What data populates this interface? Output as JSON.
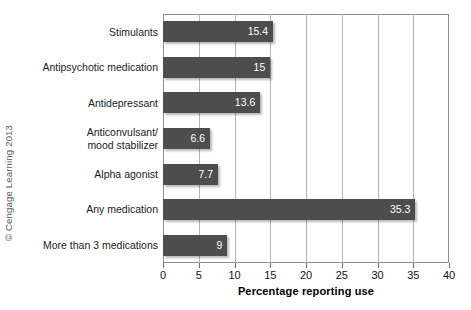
{
  "credit": "© Cengage Learning 2013",
  "chart_data": {
    "type": "bar",
    "orientation": "horizontal",
    "title": "",
    "xlabel": "Percentage reporting use",
    "ylabel": "",
    "xlim": [
      0,
      40
    ],
    "xticks": [
      0,
      5,
      10,
      15,
      20,
      25,
      30,
      35,
      40
    ],
    "xtick_labels": [
      "0",
      "5",
      "10",
      "15",
      "20",
      "25",
      "30",
      "35",
      "40"
    ],
    "grid": "vertical",
    "legend": "none",
    "bar_color": "#4d4d4d",
    "label_color": "#ffffff",
    "categories": [
      "Stimulants",
      "Antipsychotic medication",
      "Antidepressant",
      "Anticonvulsant/\nmood stabilizer",
      "Alpha agonist",
      "Any medication",
      "More than 3 medications"
    ],
    "values": [
      15.4,
      15,
      13.6,
      6.6,
      7.7,
      35.3,
      9
    ],
    "value_labels": [
      "15.4",
      "15",
      "13.6",
      "6.6",
      "7.7",
      "35.3",
      "9"
    ]
  }
}
